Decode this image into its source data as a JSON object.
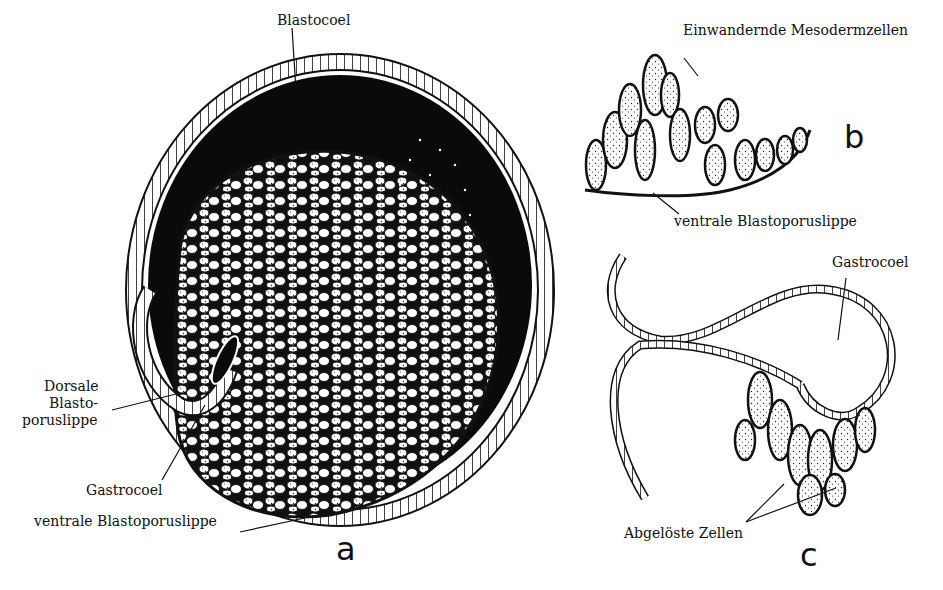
{
  "figure": {
    "panels": [
      {
        "id": "a",
        "letter": "a",
        "labels": {
          "blastocoel": "Blastocoel",
          "dorsal_lip_line1": "Dorsale",
          "dorsal_lip_line2": "Blasto-",
          "dorsal_lip_line3": "poruslippe",
          "gastrocoel": "Gastrocoel",
          "ventral_lip": "ventrale Blastoporuslippe"
        }
      },
      {
        "id": "b",
        "letter": "b",
        "labels": {
          "migrating_mesoderm": "Einwandernde Mesodermzellen",
          "ventral_lip": "ventrale Blastoporuslippe"
        }
      },
      {
        "id": "c",
        "letter": "c",
        "labels": {
          "gastrocoel": "Gastrocoel",
          "detached_cells": "Abgelöste Zellen"
        }
      }
    ]
  }
}
